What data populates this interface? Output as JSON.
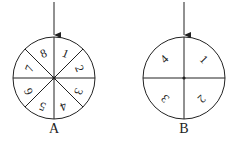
{
  "figure": {
    "spinners": [
      {
        "label": "A",
        "sectors": 8,
        "numbers": [
          "1",
          "2",
          "3",
          "4",
          "5",
          "6",
          "7",
          "8"
        ],
        "has_pointer_arrow": true
      },
      {
        "label": "B",
        "sectors": 4,
        "numbers": [
          "1",
          "2",
          "3",
          "4"
        ],
        "has_pointer_arrow": true
      }
    ]
  },
  "colors": {
    "stroke": "#222222",
    "background": "#ffffff"
  }
}
